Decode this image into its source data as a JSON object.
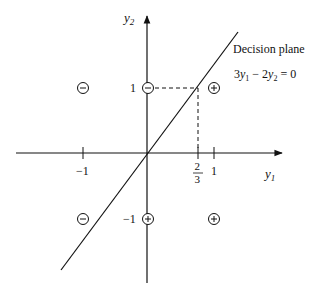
{
  "axes": {
    "x_label": "y",
    "x_label_sub": "1",
    "y_label": "y",
    "y_label_sub": "2",
    "x_ticks": [
      {
        "label": "−1",
        "px": 83
      },
      {
        "label": "1",
        "px": 214
      }
    ],
    "special_tick": {
      "numerator": "2",
      "denominator": "3",
      "px": 198
    },
    "y_ticks": [
      {
        "label": "1",
        "py": 88
      },
      {
        "label": "−1",
        "py": 219
      }
    ],
    "origin_px": [
      147,
      153
    ]
  },
  "decision_plane": {
    "title": "Decision plane",
    "equation": {
      "c1": "3",
      "v1": "y",
      "s1": "1",
      "op": " − 2",
      "v2": "y",
      "s2": "2",
      "rhs": " = 0"
    }
  },
  "points": [
    {
      "symbol": "minus",
      "glyph": "−",
      "px": [
        83,
        88
      ]
    },
    {
      "symbol": "minus",
      "glyph": "−",
      "px": [
        148,
        88
      ]
    },
    {
      "symbol": "plus",
      "glyph": "+",
      "px": [
        214,
        88
      ]
    },
    {
      "symbol": "minus",
      "glyph": "−",
      "px": [
        83,
        219
      ]
    },
    {
      "symbol": "plus",
      "glyph": "+",
      "px": [
        148,
        219
      ]
    },
    {
      "symbol": "plus",
      "glyph": "+",
      "px": [
        214,
        219
      ]
    }
  ],
  "colors": {
    "ink": "#111111",
    "background": "#ffffff"
  }
}
